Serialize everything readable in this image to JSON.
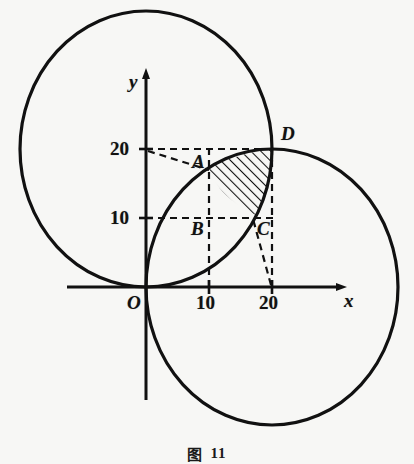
{
  "figure": {
    "caption_symbol": "图",
    "caption_number": "11",
    "background_color": "#f7f7f5",
    "ink_color": "#111111"
  },
  "axes": {
    "x_axis_label": "x",
    "y_axis_label": "y",
    "origin_label": "O",
    "x_ticks": [
      {
        "value": 10,
        "label": "10"
      },
      {
        "value": 20,
        "label": "20"
      }
    ],
    "y_ticks": [
      {
        "value": 10,
        "label": "10"
      },
      {
        "value": 20,
        "label": "20"
      }
    ],
    "origin_px": {
      "x": 146,
      "y": 287
    },
    "unit_px_x": 6.3,
    "unit_px_y": 6.9
  },
  "points": [
    {
      "name": "A",
      "label": "A",
      "x": 10,
      "y": 17.3
    },
    {
      "name": "B",
      "label": "B",
      "x": 10,
      "y": 10
    },
    {
      "name": "C",
      "label": "C",
      "x": 17.3,
      "y": 10
    },
    {
      "name": "D",
      "label": "D",
      "x": 20,
      "y": 20
    }
  ],
  "circles": [
    {
      "name": "left-circle",
      "center_x": 0,
      "center_y": 20,
      "radius": 20
    },
    {
      "name": "right-circle",
      "center_x": 20,
      "center_y": 0,
      "radius": 20
    }
  ],
  "shaded_region": {
    "name": "lens",
    "description": "hatched lens between the two circular arcs",
    "hatch_angle_deg": 45
  },
  "dashed_guides": [
    {
      "name": "y20-to-D",
      "from": [
        0,
        20
      ],
      "to": [
        20,
        20
      ]
    },
    {
      "name": "y10-to-C",
      "from": [
        0,
        10
      ],
      "to": [
        20,
        10
      ]
    },
    {
      "name": "x10-vertical",
      "from": [
        10,
        0
      ],
      "to": [
        10,
        20
      ]
    },
    {
      "name": "x20-vertical",
      "from": [
        20,
        0
      ],
      "to": [
        20,
        20
      ]
    },
    {
      "name": "radius-to-A",
      "from": [
        0,
        20
      ],
      "to": [
        10,
        17.3
      ]
    },
    {
      "name": "radius-to-C",
      "from": [
        20,
        0
      ],
      "to": [
        17.3,
        10
      ]
    }
  ]
}
